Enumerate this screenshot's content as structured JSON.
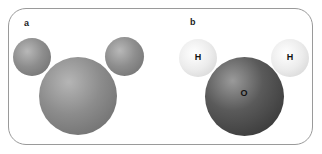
{
  "figure": {
    "panels": [
      {
        "label": "a",
        "style": "grey spheres, unlabeled"
      },
      {
        "label": "b",
        "atoms": [
          "H",
          "H",
          "O"
        ]
      }
    ],
    "colors": {
      "frame": "#9a9a9a",
      "grey_sphere": "#8e8e8e",
      "hydrogen": "#ececec",
      "oxygen": "#4a4a4a"
    }
  }
}
